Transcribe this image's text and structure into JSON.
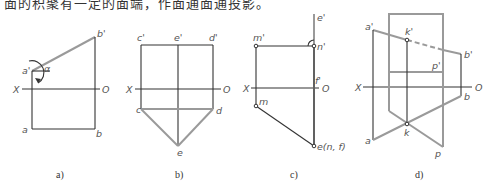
{
  "header": {
    "clipped_text": "面的积聚有一定的面端，作面通面通投影。"
  },
  "axis_labels": {
    "x": "X",
    "o": "O"
  },
  "panels": [
    {
      "caption": "a)",
      "points": {
        "a_prime": "a'",
        "b_prime": "b'",
        "a": "a",
        "b": "b",
        "alpha": "α"
      }
    },
    {
      "caption": "b)",
      "points": {
        "c_prime": "c'",
        "e_prime": "e'",
        "d_prime": "d'",
        "c": "c",
        "d": "d",
        "e": "e"
      }
    },
    {
      "caption": "c)",
      "points": {
        "m_prime": "m'",
        "n_prime": "n'",
        "e_prime": "e'",
        "f_prime": "f'",
        "m": "m",
        "e_nf": "e(n, f)"
      }
    },
    {
      "caption": "d)",
      "points": {
        "a_prime": "a'",
        "k_prime": "k'",
        "b_prime": "b'",
        "p_prime": "p'",
        "a": "a",
        "k": "k",
        "b": "b",
        "p": "p"
      }
    }
  ],
  "colors": {
    "line_black": "#333333",
    "line_gray": "#9a9a9a"
  }
}
